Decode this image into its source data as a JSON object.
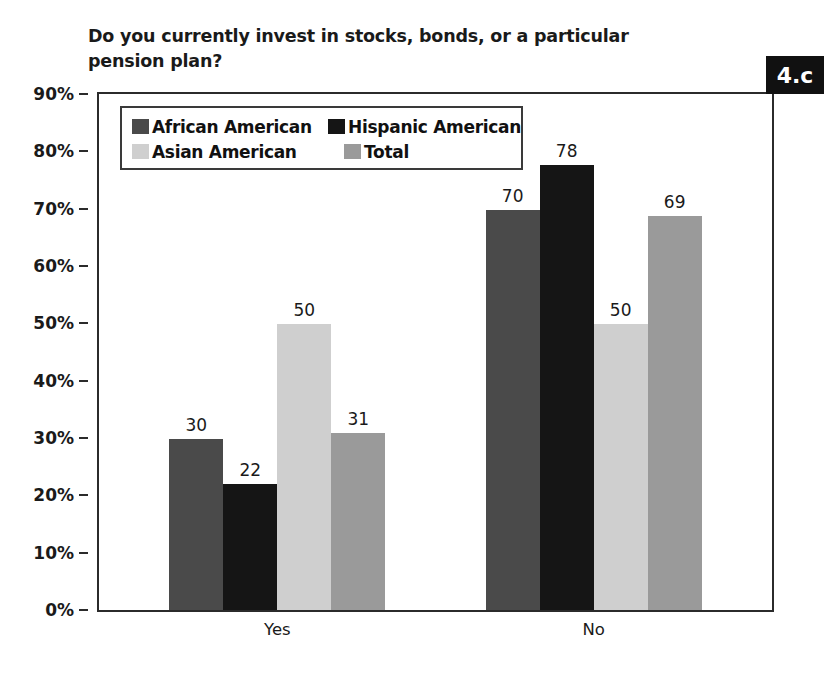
{
  "title": "Do you currently invest in stocks, bonds, or a particular pension plan?",
  "badge": "4.c",
  "legend": {
    "entries": [
      {
        "label": "African American",
        "color": "#4a4a4a"
      },
      {
        "label": "Hispanic American",
        "color": "#151515"
      },
      {
        "label": "Asian American",
        "color": "#cfcfcf"
      },
      {
        "label": "Total",
        "color": "#9a9a9a"
      }
    ]
  },
  "axis": {
    "y_ticks": [
      "0%",
      "10%",
      "20%",
      "30%",
      "40%",
      "50%",
      "60%",
      "70%",
      "80%",
      "90%"
    ],
    "x_ticks": [
      "Yes",
      "No"
    ]
  },
  "chart_data": {
    "type": "bar",
    "title": "Do you currently invest in stocks, bonds, or a particular pension plan?",
    "xlabel": "",
    "ylabel": "",
    "ylim": [
      0,
      90
    ],
    "ytick_step": 10,
    "ytick_suffix": "%",
    "grid": false,
    "legend_position": "top-left-inside",
    "categories": [
      "Yes",
      "No"
    ],
    "series": [
      {
        "name": "African American",
        "color": "#4a4a4a",
        "values": [
          30,
          70
        ]
      },
      {
        "name": "Hispanic American",
        "color": "#151515",
        "values": [
          22,
          78
        ]
      },
      {
        "name": "Asian American",
        "color": "#cfcfcf",
        "values": [
          50,
          50
        ]
      },
      {
        "name": "Total",
        "color": "#9a9a9a",
        "values": [
          31,
          69
        ]
      }
    ]
  }
}
